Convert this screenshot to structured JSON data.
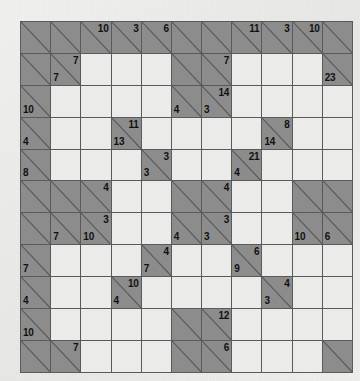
{
  "puzzle": {
    "type": "kakuro",
    "rows": 11,
    "cols": 11,
    "colors": {
      "clue_cell": "#8c8c8c",
      "entry_cell": "#ebebe9",
      "grid_line": "#5a5a5a",
      "page_background": "#ececeb",
      "clue_text": "#111111"
    },
    "cells": [
      [
        {
          "t": "clue"
        },
        {
          "t": "clue"
        },
        {
          "t": "clue",
          "down": "10"
        },
        {
          "t": "clue",
          "down": "3"
        },
        {
          "t": "clue",
          "down": "6"
        },
        {
          "t": "clue"
        },
        {
          "t": "clue"
        },
        {
          "t": "clue",
          "down": "11"
        },
        {
          "t": "clue",
          "down": "3"
        },
        {
          "t": "clue",
          "down": "10"
        },
        {
          "t": "clue"
        }
      ],
      [
        {
          "t": "clue"
        },
        {
          "t": "clue",
          "down": "7",
          "across": "7"
        },
        {
          "t": "white"
        },
        {
          "t": "white"
        },
        {
          "t": "white"
        },
        {
          "t": "clue"
        },
        {
          "t": "clue",
          "down": "7"
        },
        {
          "t": "white"
        },
        {
          "t": "white"
        },
        {
          "t": "white"
        },
        {
          "t": "clue",
          "across": "23"
        }
      ],
      [
        {
          "t": "clue",
          "across": "10"
        },
        {
          "t": "white"
        },
        {
          "t": "white"
        },
        {
          "t": "white"
        },
        {
          "t": "white"
        },
        {
          "t": "clue",
          "across": "4"
        },
        {
          "t": "clue",
          "down": "14",
          "across": "3"
        },
        {
          "t": "white"
        },
        {
          "t": "white"
        },
        {
          "t": "white"
        },
        {
          "t": "white"
        }
      ],
      [
        {
          "t": "clue",
          "across": "4"
        },
        {
          "t": "white"
        },
        {
          "t": "white"
        },
        {
          "t": "clue",
          "down": "11",
          "across": "13"
        },
        {
          "t": "white"
        },
        {
          "t": "white"
        },
        {
          "t": "white"
        },
        {
          "t": "white"
        },
        {
          "t": "clue",
          "down": "8",
          "across": "14"
        },
        {
          "t": "white"
        },
        {
          "t": "white"
        }
      ],
      [
        {
          "t": "clue",
          "across": "8"
        },
        {
          "t": "white"
        },
        {
          "t": "white"
        },
        {
          "t": "white"
        },
        {
          "t": "clue",
          "down": "3",
          "across": "3"
        },
        {
          "t": "white"
        },
        {
          "t": "white"
        },
        {
          "t": "clue",
          "down": "21",
          "across": "4"
        },
        {
          "t": "white"
        },
        {
          "t": "white"
        },
        {
          "t": "white"
        }
      ],
      [
        {
          "t": "clue"
        },
        {
          "t": "clue"
        },
        {
          "t": "clue",
          "down": "4"
        },
        {
          "t": "white"
        },
        {
          "t": "white"
        },
        {
          "t": "clue"
        },
        {
          "t": "clue",
          "down": "4"
        },
        {
          "t": "white"
        },
        {
          "t": "white"
        },
        {
          "t": "clue"
        },
        {
          "t": "clue"
        }
      ],
      [
        {
          "t": "clue"
        },
        {
          "t": "clue",
          "across": "7"
        },
        {
          "t": "clue",
          "down": "3",
          "across": "10"
        },
        {
          "t": "white"
        },
        {
          "t": "white"
        },
        {
          "t": "clue",
          "across": "4"
        },
        {
          "t": "clue",
          "down": "3",
          "across": "3"
        },
        {
          "t": "white"
        },
        {
          "t": "white"
        },
        {
          "t": "clue",
          "across": "10"
        },
        {
          "t": "clue",
          "across": "6"
        }
      ],
      [
        {
          "t": "clue",
          "across": "7"
        },
        {
          "t": "white"
        },
        {
          "t": "white"
        },
        {
          "t": "white"
        },
        {
          "t": "clue",
          "down": "4",
          "across": "7"
        },
        {
          "t": "white"
        },
        {
          "t": "white"
        },
        {
          "t": "clue",
          "down": "6",
          "across": "9"
        },
        {
          "t": "white"
        },
        {
          "t": "white"
        },
        {
          "t": "white"
        }
      ],
      [
        {
          "t": "clue",
          "across": "4"
        },
        {
          "t": "white"
        },
        {
          "t": "white"
        },
        {
          "t": "clue",
          "down": "10",
          "across": "4"
        },
        {
          "t": "white"
        },
        {
          "t": "white"
        },
        {
          "t": "white"
        },
        {
          "t": "white"
        },
        {
          "t": "clue",
          "down": "4",
          "across": "3"
        },
        {
          "t": "white"
        },
        {
          "t": "white"
        }
      ],
      [
        {
          "t": "clue",
          "across": "10"
        },
        {
          "t": "white"
        },
        {
          "t": "white"
        },
        {
          "t": "white"
        },
        {
          "t": "white"
        },
        {
          "t": "clue"
        },
        {
          "t": "clue",
          "down": "12"
        },
        {
          "t": "white"
        },
        {
          "t": "white"
        },
        {
          "t": "white"
        },
        {
          "t": "white"
        }
      ],
      [
        {
          "t": "clue"
        },
        {
          "t": "clue",
          "down": "7"
        },
        {
          "t": "white"
        },
        {
          "t": "white"
        },
        {
          "t": "white"
        },
        {
          "t": "clue"
        },
        {
          "t": "clue",
          "down": "6"
        },
        {
          "t": "white"
        },
        {
          "t": "white"
        },
        {
          "t": "white"
        },
        {
          "t": "clue"
        }
      ]
    ]
  }
}
